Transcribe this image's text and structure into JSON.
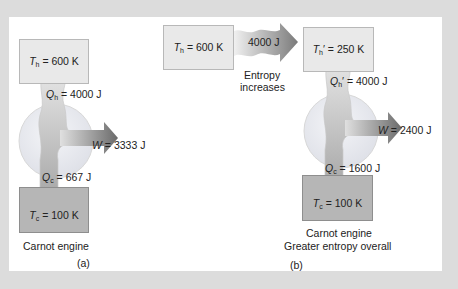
{
  "figure": {
    "panel_a": {
      "hot_reservoir": {
        "symbol": "T",
        "sub": "h",
        "value": "= 600  K"
      },
      "heat_in": {
        "symbol": "Q",
        "sub": "h",
        "value": "= 4000  J"
      },
      "work": {
        "symbol": "W",
        "value": "= 3333  J"
      },
      "heat_out": {
        "symbol": "Q",
        "sub": "c",
        "value": "= 667  J"
      },
      "cold_reservoir": {
        "symbol": "T",
        "sub": "c",
        "value": "= 100  K"
      },
      "caption": "Carnot engine",
      "label": "(a)"
    },
    "panel_b": {
      "source_reservoir": {
        "symbol": "T",
        "sub": "h",
        "value": "= 600  K"
      },
      "transfer_arrow": "4000  J",
      "transfer_caption_line1": "Entropy",
      "transfer_caption_line2": "increases",
      "hot_reservoir": {
        "symbol": "T",
        "sub": "h",
        "prime": "′",
        "value": "= 250 K"
      },
      "heat_in": {
        "symbol": "Q",
        "sub": "h",
        "prime": "′",
        "value": "= 4000  J"
      },
      "work": {
        "symbol": "W",
        "value": "= 2400  J"
      },
      "heat_out": {
        "symbol": "Q",
        "sub": "c",
        "value": "= 1600  J"
      },
      "cold_reservoir": {
        "symbol": "T",
        "sub": "c",
        "value": "= 100  K"
      },
      "caption_line1": "Carnot engine",
      "caption_line2": "Greater entropy overall",
      "label": "(b)"
    },
    "colors": {
      "background": "#dcdcdc",
      "panel": "#ffffff",
      "hot_box": "#e9e9e9",
      "cold_box": "#b6b6b6",
      "engine_circle": "#e8eaf0",
      "arrow_dark": "#6d6d6d",
      "arrow_light": "#d0d0d0"
    }
  }
}
